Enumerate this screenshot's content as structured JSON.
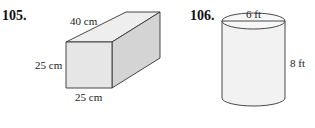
{
  "problems": [
    {
      "number": "105.",
      "shape": "rectangular-prism",
      "labels": {
        "length": "40 cm",
        "height": "25 cm",
        "width": "25 cm"
      }
    },
    {
      "number": "106.",
      "shape": "cylinder",
      "labels": {
        "diameter": "6 ft",
        "height": "8 ft"
      }
    }
  ],
  "colors": {
    "stroke": "#333333",
    "front_face": "#e6e6e6",
    "top_face": "#eeeeee",
    "side_face": "#d4d4d4",
    "cylinder_fill": "#f2f2f2"
  }
}
